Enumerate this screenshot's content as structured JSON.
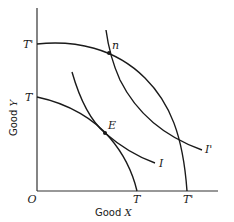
{
  "diagram": {
    "axes": {
      "origin_label": "O",
      "x_label_text": "Good ",
      "x_label_var": "X",
      "y_label_text": "Good ",
      "y_label_var": "Y"
    },
    "curves": [
      {
        "id": "TT",
        "type": "production-possibility-frontier",
        "y_intercept_label": "T",
        "x_intercept_label": "T"
      },
      {
        "id": "T'T'",
        "type": "production-possibility-frontier",
        "y_intercept_label": "T'",
        "x_intercept_label": "T'"
      },
      {
        "id": "I",
        "type": "indifference-curve",
        "label": "I"
      },
      {
        "id": "I'",
        "type": "indifference-curve",
        "label": "I'"
      }
    ],
    "points": [
      {
        "id": "E",
        "label": "E",
        "description": "tangency of TT and I"
      },
      {
        "id": "n",
        "label": "n",
        "description": "intersection of T'T' and I'"
      }
    ]
  }
}
